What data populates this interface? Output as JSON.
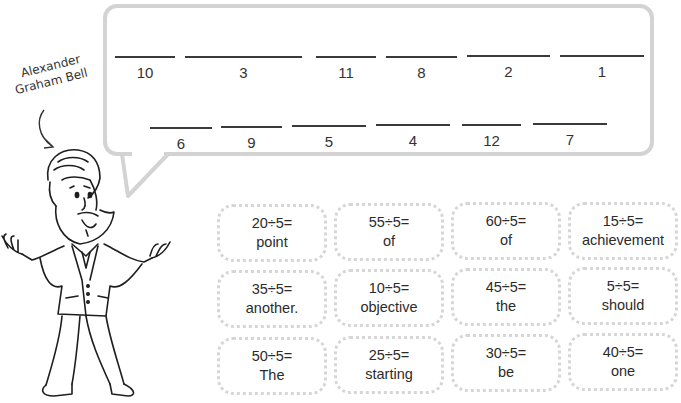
{
  "character": {
    "name_line1": "Alexander",
    "name_line2": "Graham Bell"
  },
  "puzzle": {
    "top_row": [
      {
        "number": "10",
        "x": 115,
        "w": 60
      },
      {
        "number": "3",
        "x": 185,
        "w": 117
      },
      {
        "number": "11",
        "x": 316,
        "w": 60
      },
      {
        "number": "8",
        "x": 386,
        "w": 71
      },
      {
        "number": "2",
        "x": 467,
        "w": 83
      },
      {
        "number": "1",
        "x": 560,
        "w": 84
      }
    ],
    "bottom_row": [
      {
        "number": "6",
        "x": 150,
        "w": 62
      },
      {
        "number": "9",
        "x": 221,
        "w": 61
      },
      {
        "number": "5",
        "x": 292,
        "w": 74
      },
      {
        "number": "4",
        "x": 376,
        "w": 74
      },
      {
        "number": "12",
        "x": 462,
        "w": 59
      },
      {
        "number": "7",
        "x": 533,
        "w": 74
      }
    ]
  },
  "cards": [
    {
      "equation": "20÷5=",
      "word": "point"
    },
    {
      "equation": "55÷5=",
      "word": "of"
    },
    {
      "equation": "60÷5=",
      "word": "of"
    },
    {
      "equation": "15÷5=",
      "word": "achievement"
    },
    {
      "equation": "35÷5=",
      "word": "another."
    },
    {
      "equation": "10÷5=",
      "word": "objective"
    },
    {
      "equation": "45÷5=",
      "word": "the"
    },
    {
      "equation": "5÷5=",
      "word": "should"
    },
    {
      "equation": "50÷5=",
      "word": "The"
    },
    {
      "equation": "25÷5=",
      "word": "starting"
    },
    {
      "equation": "30÷5=",
      "word": "be"
    },
    {
      "equation": "40÷5=",
      "word": "one"
    }
  ],
  "colors": {
    "bubble_border": "#d3d3d3",
    "card_border": "#d6d6d6",
    "text": "#2b2b2b"
  }
}
